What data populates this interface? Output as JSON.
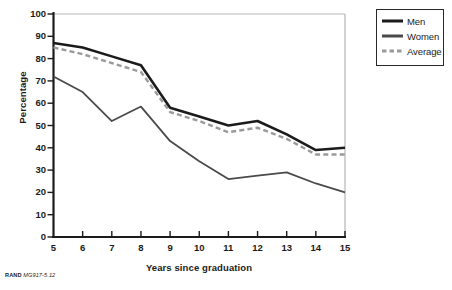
{
  "chart_data": {
    "type": "line",
    "title": "",
    "xlabel": "Years since graduation",
    "ylabel": "Percentage",
    "x": [
      5,
      6,
      7,
      8,
      9,
      10,
      11,
      12,
      13,
      14,
      15
    ],
    "xlim": [
      5,
      15
    ],
    "ylim": [
      0,
      100
    ],
    "ytick_labels": [
      "0",
      "10",
      "20",
      "30",
      "40",
      "50",
      "60",
      "70",
      "80",
      "90",
      "100"
    ],
    "ytick_values": [
      0,
      10,
      20,
      30,
      40,
      50,
      60,
      70,
      80,
      90,
      100
    ],
    "xtick_labels": [
      "5",
      "6",
      "7",
      "8",
      "9",
      "10",
      "11",
      "12",
      "13",
      "14",
      "15"
    ],
    "grid": false,
    "legend_position": "outside-top-right",
    "series": [
      {
        "name": "Men",
        "style": "solid",
        "color": "#1b1b1b",
        "width": 2.6,
        "values": [
          87,
          85,
          81,
          77,
          58,
          54,
          50,
          52,
          46,
          39,
          40
        ]
      },
      {
        "name": "Women",
        "style": "solid",
        "color": "#4a4a4a",
        "width": 1.8,
        "values": [
          72,
          65,
          52,
          58.5,
          43,
          34,
          26,
          27.5,
          29,
          24,
          20
        ]
      },
      {
        "name": "Average",
        "style": "dashed",
        "color": "#9a9a9a",
        "width": 2.4,
        "values": [
          85,
          82,
          78,
          74,
          56,
          52,
          47,
          49,
          44,
          37,
          37
        ]
      }
    ]
  },
  "legend": {
    "items": [
      {
        "label": "Men"
      },
      {
        "label": "Women"
      },
      {
        "label": "Average"
      }
    ]
  },
  "credit": {
    "org": "RAND",
    "code": "MG917-5.12"
  },
  "colors": {
    "men": "#1b1b1b",
    "women": "#4a4a4a",
    "average": "#9a9a9a",
    "axis": "#1b1b1b",
    "frame": "#b5b5b5",
    "background": "#ffffff"
  }
}
